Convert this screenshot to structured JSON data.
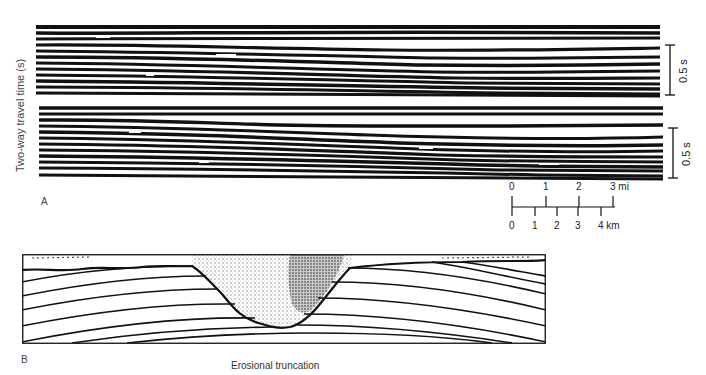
{
  "figure": {
    "panel_a": {
      "letter": "A",
      "y_axis_label": "Two-way travel time (s)",
      "sections": [
        {
          "name": "upper-seismic-section",
          "time_scale_label": "0.5 s"
        },
        {
          "name": "lower-seismic-section",
          "time_scale_label": "0.5 s"
        }
      ],
      "distance_scale": {
        "miles": {
          "ticks": [
            "0",
            "1",
            "2",
            "3"
          ],
          "unit": "mi",
          "last_label": "3 mi"
        },
        "kilometers": {
          "ticks": [
            "0",
            "1",
            "2",
            "3",
            "4"
          ],
          "unit": "km",
          "last_label": "4 km"
        }
      }
    },
    "panel_b": {
      "letter": "B",
      "caption": "Erosional truncation"
    }
  },
  "colors": {
    "ink": "#111111",
    "paper": "#ffffff",
    "fill_stipple": "#9a9a9a"
  }
}
